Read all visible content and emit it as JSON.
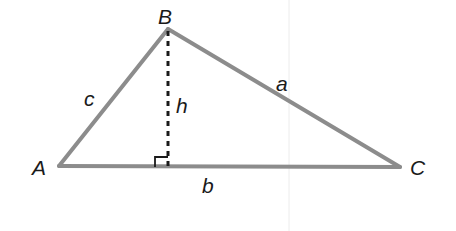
{
  "diagram": {
    "colors": {
      "edge": "#8c8c8c",
      "altitude": "#1a1a1a",
      "text": "#1a1a1a",
      "guide": "#ececec"
    },
    "vertices": [
      {
        "name": "A",
        "x": 59,
        "y": 166
      },
      {
        "name": "B",
        "x": 168,
        "y": 29
      },
      {
        "name": "C",
        "x": 400,
        "y": 167
      }
    ],
    "altitude_foot": {
      "x": 168,
      "y": 166
    },
    "labels": {
      "A": "A",
      "B": "B",
      "C": "C",
      "a": "a",
      "b": "b",
      "c": "c",
      "h": "h"
    }
  }
}
